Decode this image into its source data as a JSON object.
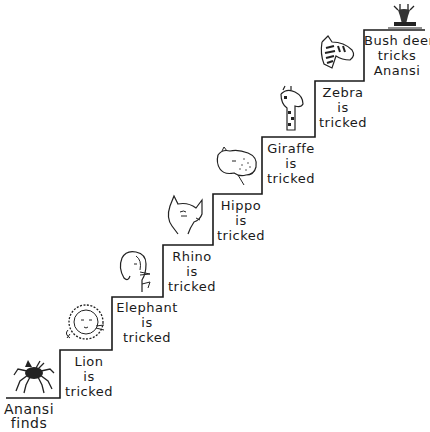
{
  "diagram": {
    "type": "staircase",
    "direction": "bottom-left to top-right",
    "steps": [
      {
        "id": "anansi-finds",
        "lines": [
          "Anansi",
          "finds"
        ],
        "animal": "spider-icon"
      },
      {
        "id": "lion",
        "lines": [
          "Lion",
          "is",
          "tricked"
        ],
        "animal": "lion-icon"
      },
      {
        "id": "elephant",
        "lines": [
          "Elephant",
          "is",
          "tricked"
        ],
        "animal": "elephant-icon"
      },
      {
        "id": "rhino",
        "lines": [
          "Rhino",
          "is",
          "tricked"
        ],
        "animal": "rhino-icon"
      },
      {
        "id": "hippo",
        "lines": [
          "Hippo",
          "is",
          "tricked"
        ],
        "animal": "hippo-icon"
      },
      {
        "id": "giraffe",
        "lines": [
          "Giraffe",
          "is",
          "tricked"
        ],
        "animal": "giraffe-icon"
      },
      {
        "id": "zebra",
        "lines": [
          "Zebra",
          "is",
          "tricked"
        ],
        "animal": "zebra-icon"
      },
      {
        "id": "bushdeer",
        "lines": [
          "Bush deer",
          "tricks",
          "Anansi"
        ],
        "animal": "bush-deer-icon"
      }
    ],
    "line_color": "#1a1a1a"
  }
}
